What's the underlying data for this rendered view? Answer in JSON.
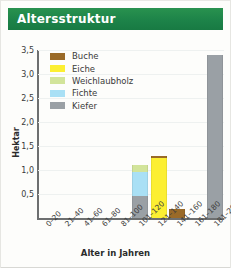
{
  "header": {
    "title": "Altersstruktur",
    "bar_color": "#1f8a4c",
    "text_color": "#ffffff"
  },
  "chart_data": {
    "type": "bar",
    "subtype": "stacked",
    "title": "Altersstruktur",
    "xlabel": "Alter in Jahren",
    "ylabel": "Hektar",
    "categories": [
      "0–20",
      "21–40",
      "41–60",
      "61–80",
      "81–100",
      "101–120",
      "121–140",
      "141–160",
      "161–180",
      "181–200"
    ],
    "ylim": [
      0,
      3.5
    ],
    "yticks": [
      0.5,
      1.0,
      1.5,
      2.0,
      2.5,
      3.0,
      3.5
    ],
    "ytick_labels": [
      "0,5",
      "1,0",
      "1,5",
      "2,0",
      "2,5",
      "3,0",
      "3,5"
    ],
    "grid": true,
    "legend_position": "upper-left-inside",
    "series": [
      {
        "name": "Buche",
        "color": "#9a6a28",
        "values": [
          0,
          0,
          0,
          0,
          0,
          0,
          0.05,
          0.19,
          0,
          0
        ]
      },
      {
        "name": "Eiche",
        "color": "#fcef32",
        "values": [
          0,
          0,
          0,
          0,
          0,
          0,
          1.25,
          0,
          0,
          0
        ]
      },
      {
        "name": "Weichlaubholz",
        "color": "#d2e49a",
        "values": [
          0,
          0,
          0,
          0,
          0,
          0.15,
          0,
          0,
          0,
          0
        ]
      },
      {
        "name": "Fichte",
        "color": "#a9e0f5",
        "values": [
          0,
          0,
          0,
          0,
          0,
          0.5,
          0,
          0,
          0,
          0
        ]
      },
      {
        "name": "Kiefer",
        "color": "#9aa0a5",
        "values": [
          0,
          0,
          0,
          0,
          0,
          0.45,
          0,
          0,
          0,
          3.4
        ]
      }
    ]
  },
  "legend": {
    "items": [
      {
        "label": "Buche",
        "color": "#9a6a28"
      },
      {
        "label": "Eiche",
        "color": "#fcef32"
      },
      {
        "label": "Weichlaubholz",
        "color": "#d2e49a"
      },
      {
        "label": "Fichte",
        "color": "#a9e0f5"
      },
      {
        "label": "Kiefer",
        "color": "#9aa0a5"
      }
    ]
  }
}
